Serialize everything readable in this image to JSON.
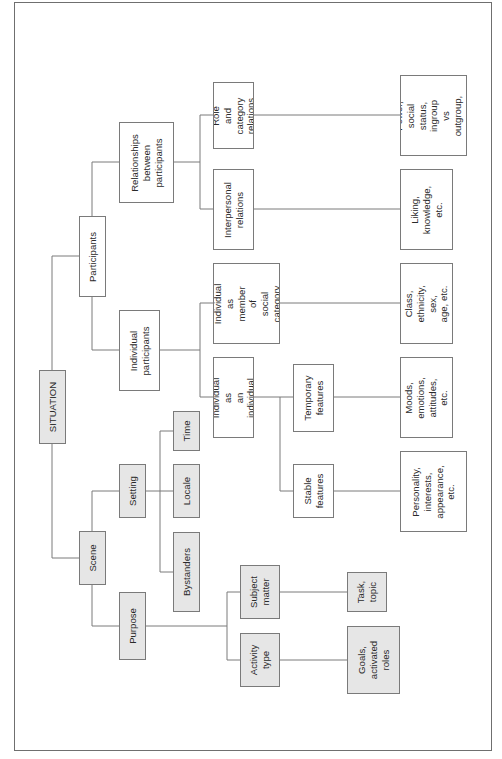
{
  "diagram": {
    "orientation": "rotated-90-ccw",
    "colors": {
      "line": "#7a7a7a",
      "grey_fill": "#e6e6e6",
      "white_fill": "#ffffff",
      "text": "#2a2a2a"
    },
    "nodes": {
      "situation": {
        "label": "SITUATION",
        "fill": "grey"
      },
      "participants": {
        "label": "Participants",
        "fill": "white"
      },
      "scene": {
        "label": "Scene",
        "fill": "grey"
      },
      "relationships": {
        "label": "Relationships\nbetween\nparticipants",
        "fill": "white"
      },
      "individual_participants": {
        "label": "Individual\nparticipants",
        "fill": "white"
      },
      "setting": {
        "label": "Setting",
        "fill": "grey"
      },
      "purpose": {
        "label": "Purpose",
        "fill": "grey"
      },
      "role_category": {
        "label": "Role and\ncategory\nrelations",
        "fill": "white"
      },
      "interpersonal": {
        "label": "Interpersonal\nrelations",
        "fill": "white"
      },
      "member_social": {
        "label": "Individual as\nmember of\nsocial\ncategory",
        "fill": "white"
      },
      "as_individual": {
        "label": "Individual as\nan individual",
        "fill": "white"
      },
      "time": {
        "label": "Time",
        "fill": "grey"
      },
      "locale": {
        "label": "Locale",
        "fill": "grey"
      },
      "bystanders": {
        "label": "Bystanders",
        "fill": "grey"
      },
      "subject_matter": {
        "label": "Subject\nmatter",
        "fill": "grey"
      },
      "activity_type": {
        "label": "Activity\ntype",
        "fill": "grey"
      },
      "temporary": {
        "label": "Temporary\nfeatures",
        "fill": "white"
      },
      "stable": {
        "label": "Stable\nfeatures",
        "fill": "white"
      },
      "power": {
        "label": "Power, social\nstatus,\ningroup vs\noutgroup, etc.",
        "fill": "white"
      },
      "liking": {
        "label": "Liking,\nknowledge,\netc.",
        "fill": "white"
      },
      "class": {
        "label": "Class,\nethnicity, sex,\nage, etc.",
        "fill": "white"
      },
      "moods": {
        "label": "Moods,\nemotions,\nattitudes, etc.",
        "fill": "white"
      },
      "personality": {
        "label": "Personality,\ninterests,\nappearance,\netc.",
        "fill": "white"
      },
      "task_topic": {
        "label": "Task,\ntopic",
        "fill": "grey"
      },
      "goals": {
        "label": "Goals,\nactivated\nroles",
        "fill": "grey"
      }
    },
    "edges": [
      [
        "situation",
        "participants"
      ],
      [
        "situation",
        "scene"
      ],
      [
        "participants",
        "relationships"
      ],
      [
        "participants",
        "individual_participants"
      ],
      [
        "scene",
        "setting"
      ],
      [
        "scene",
        "purpose"
      ],
      [
        "relationships",
        "role_category"
      ],
      [
        "relationships",
        "interpersonal"
      ],
      [
        "individual_participants",
        "member_social"
      ],
      [
        "individual_participants",
        "as_individual"
      ],
      [
        "setting",
        "time"
      ],
      [
        "setting",
        "locale"
      ],
      [
        "setting",
        "bystanders"
      ],
      [
        "purpose",
        "subject_matter"
      ],
      [
        "purpose",
        "activity_type"
      ],
      [
        "as_individual",
        "temporary"
      ],
      [
        "as_individual",
        "stable"
      ],
      [
        "role_category",
        "power"
      ],
      [
        "interpersonal",
        "liking"
      ],
      [
        "member_social",
        "class"
      ],
      [
        "temporary",
        "moods"
      ],
      [
        "stable",
        "personality"
      ],
      [
        "subject_matter",
        "task_topic"
      ],
      [
        "activity_type",
        "goals"
      ]
    ]
  }
}
